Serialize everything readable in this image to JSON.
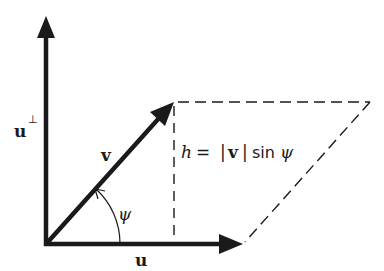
{
  "diagram": {
    "colors": {
      "ink": "#1a1a1a",
      "background": "#ffffff"
    },
    "labels": {
      "u": "u",
      "u_perp": "u",
      "perp_symbol": "⊥",
      "v": "v",
      "psi": "ψ",
      "height_formula": {
        "h": "h",
        "equals": "=",
        "abs_open": "|",
        "v": "v",
        "abs_close": "|",
        "sin": "sin",
        "psi": "ψ"
      }
    },
    "geometry": {
      "origin": [
        46,
        244
      ],
      "u_perp_tip": [
        46,
        16
      ],
      "u_tip": [
        243,
        244
      ],
      "v_tip": [
        174,
        102
      ],
      "parallelogram_far_corner": [
        370,
        102
      ],
      "angle_arc_radius": 74
    },
    "elements": [
      "vector u (horizontal arrow)",
      "vector u-perp (vertical arrow)",
      "vector v (diagonal arrow)",
      "dashed height line h",
      "dashed parallelogram edges",
      "angle arc psi"
    ]
  }
}
